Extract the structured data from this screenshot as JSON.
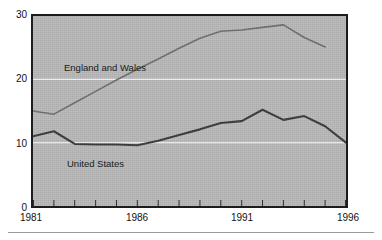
{
  "chart_data": {
    "type": "line",
    "title": "",
    "subtitle": "",
    "xlabel": "",
    "ylabel": "",
    "x": [
      1981,
      1982,
      1983,
      1984,
      1985,
      1986,
      1987,
      1988,
      1989,
      1990,
      1991,
      1992,
      1993,
      1994,
      1995,
      1996
    ],
    "xlim": [
      1981,
      1996
    ],
    "ylim": [
      0,
      30
    ],
    "yticks": [
      0,
      10,
      20,
      30
    ],
    "ytick_labels": [
      "0",
      "10",
      "20",
      "30"
    ],
    "xticks": [
      1981,
      1982,
      1983,
      1984,
      1985,
      1986,
      1987,
      1988,
      1989,
      1990,
      1991,
      1992,
      1993,
      1994,
      1995,
      1996
    ],
    "xtick_labels_shown": [
      "1981",
      "1986",
      "1991",
      "1996"
    ],
    "grid": "horizontal-white-at-10-and-20",
    "legend_position": "inline-annotation",
    "plot_background": "#b9b9b9",
    "series": [
      {
        "name": "England and Wales",
        "color": "#6e6e6e",
        "label_x": 1983.0,
        "label_y": 22.0,
        "values": [
          15.0,
          14.5,
          16.3,
          18.1,
          19.9,
          21.6,
          23.2,
          24.9,
          26.5,
          27.6,
          27.8,
          28.2,
          28.6,
          26.6,
          25.1,
          null
        ]
      },
      {
        "name": "United States",
        "color": "#3a3a3a",
        "label_x": 1983.1,
        "label_y": 7.6,
        "values": [
          11.0,
          11.8,
          9.8,
          9.7,
          9.7,
          9.6,
          10.3,
          11.2,
          12.1,
          13.1,
          13.4,
          15.2,
          13.6,
          14.2,
          12.6,
          10.0
        ]
      }
    ]
  },
  "axes": {
    "y_ticks": [
      {
        "label": "30",
        "value": 30
      },
      {
        "label": "20",
        "value": 20
      },
      {
        "label": "10",
        "value": 10
      },
      {
        "label": "0",
        "value": 0
      }
    ],
    "x_ticks": [
      {
        "label": "1981",
        "value": 1981
      },
      {
        "label": "1986",
        "value": 1986
      },
      {
        "label": "1991",
        "value": 1991
      },
      {
        "label": "1996",
        "value": 1996
      }
    ]
  },
  "annotations": {
    "england_label": "England and Wales",
    "us_label": "United States"
  }
}
